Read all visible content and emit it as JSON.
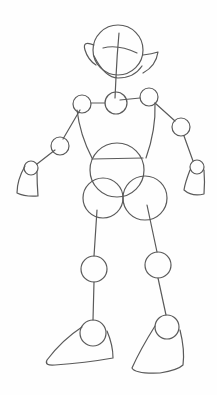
{
  "drawing": {
    "subject": "pencil sketch of a robot-like figure constructed from circles and lines",
    "stroke_color": "#5a5a5a",
    "background": "#fefefe",
    "parts": {
      "head": {
        "cx": 118,
        "cy": 50,
        "r": 25
      },
      "ear_left": {
        "x": 93,
        "y": 43
      },
      "ear_right": {
        "x": 145,
        "y": 56
      },
      "neck_joint": {
        "cx": 116,
        "cy": 103,
        "r": 11
      },
      "shoulder_left": {
        "cx": 82,
        "cy": 104,
        "r": 9
      },
      "shoulder_right": {
        "cx": 149,
        "cy": 97,
        "r": 9
      },
      "elbow_left": {
        "cx": 60,
        "cy": 146,
        "r": 9
      },
      "elbow_right": {
        "cx": 181,
        "cy": 127,
        "r": 9
      },
      "wrist_left": {
        "cx": 31,
        "cy": 168,
        "r": 7
      },
      "wrist_right": {
        "cx": 197,
        "cy": 167,
        "r": 7
      },
      "torso": {
        "cx": 117,
        "cy": 170,
        "r": 27
      },
      "hip_left": {
        "cx": 103,
        "cy": 198,
        "r": 20
      },
      "hip_right": {
        "cx": 145,
        "cy": 198,
        "r": 22
      },
      "knee_left": {
        "cx": 94,
        "cy": 269,
        "r": 13
      },
      "knee_right": {
        "cx": 158,
        "cy": 265,
        "r": 13
      },
      "ankle_left": {
        "cx": 93,
        "cy": 333,
        "r": 13
      },
      "ankle_right": {
        "cx": 167,
        "cy": 327,
        "r": 12
      }
    }
  }
}
